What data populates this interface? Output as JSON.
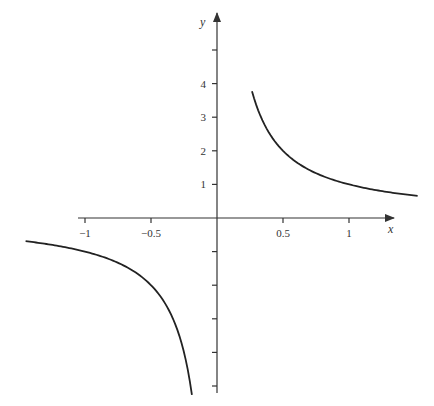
{
  "chart_data": {
    "type": "line",
    "title": "",
    "function": "y = 1/x",
    "xlabel": "x",
    "ylabel": "y",
    "x_ticks": [
      -1,
      -0.5,
      0.5,
      1
    ],
    "x_tick_labels": [
      "−1",
      "−0.5",
      "0.5",
      "1"
    ],
    "y_ticks": [
      -5,
      -4,
      -3,
      -2,
      -1,
      1,
      2,
      3,
      4,
      5
    ],
    "y_tick_labels": [
      "",
      "",
      "",
      "",
      "",
      "1",
      "2",
      "3",
      "4",
      ""
    ],
    "xlim": [
      -1.65,
      1.6
    ],
    "ylim": [
      -5.3,
      5.4
    ],
    "grid": false,
    "legend": null,
    "series": [
      {
        "name": "right branch",
        "x": [
          0.265,
          0.3,
          0.35,
          0.4,
          0.5,
          0.6,
          0.7,
          0.8,
          1.0,
          1.2,
          1.4,
          1.52
        ],
        "values": [
          3.77,
          3.33,
          2.86,
          2.5,
          2.0,
          1.67,
          1.43,
          1.25,
          1.0,
          0.83,
          0.71,
          0.66
        ]
      },
      {
        "name": "left branch",
        "x": [
          -1.45,
          -1.2,
          -1.0,
          -0.8,
          -0.6,
          -0.5,
          -0.4,
          -0.3,
          -0.25,
          -0.19
        ],
        "values": [
          -0.69,
          -0.83,
          -1.0,
          -1.25,
          -1.67,
          -2.0,
          -2.5,
          -3.33,
          -4.0,
          -5.26
        ]
      }
    ],
    "colors": {
      "curve": "#222222",
      "axes": "#333333"
    }
  },
  "axes": {
    "x_label": "x",
    "y_label": "y"
  }
}
